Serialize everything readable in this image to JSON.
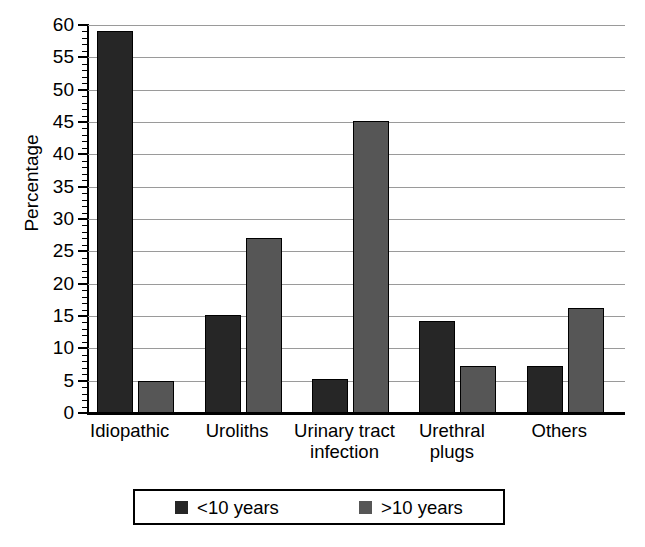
{
  "chart_data": {
    "type": "bar",
    "title": "",
    "xlabel": "",
    "ylabel": "Percentage",
    "ylim": [
      0,
      60
    ],
    "ytick_step": 5,
    "minor_tick_step": 1,
    "grid": true,
    "legend_position": "bottom",
    "categories": [
      "Idiopathic",
      "Uroliths",
      "Urinary tract infection",
      "Urethral plugs",
      "Others"
    ],
    "category_lines": [
      [
        "Idiopathic"
      ],
      [
        "Uroliths"
      ],
      [
        "Urinary tract",
        "infection"
      ],
      [
        "Urethral",
        "plugs"
      ],
      [
        "Others"
      ]
    ],
    "ytick_labels": [
      "0",
      "5",
      "10",
      "15",
      "20",
      "25",
      "30",
      "35",
      "40",
      "45",
      "50",
      "55",
      "60"
    ],
    "ytick_values": [
      0,
      5,
      10,
      15,
      20,
      25,
      30,
      35,
      40,
      45,
      50,
      55,
      60
    ],
    "series": [
      {
        "name": "<10 years",
        "color": "#262626",
        "values": [
          59,
          15.1,
          5.3,
          14.3,
          7.3
        ]
      },
      {
        "name": ">10 years",
        "color": "#565656",
        "values": [
          5,
          27,
          45.1,
          7.3,
          16.3
        ]
      }
    ]
  },
  "legend": {
    "entries": [
      {
        "label": "<10 years",
        "color": "#262626"
      },
      {
        "label": ">10 years",
        "color": "#565656"
      }
    ]
  },
  "caption": {
    "text": ""
  }
}
